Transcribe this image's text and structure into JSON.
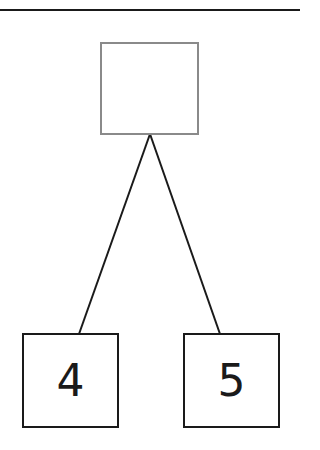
{
  "diagram": {
    "type": "number-bond",
    "whole": {
      "value": "",
      "state": "empty"
    },
    "parts": [
      {
        "value": "4"
      },
      {
        "value": "5"
      }
    ],
    "colors": {
      "whole_border": "#8a8a8a",
      "part_border": "#1a1a1a",
      "line": "#1a1a1a"
    }
  }
}
